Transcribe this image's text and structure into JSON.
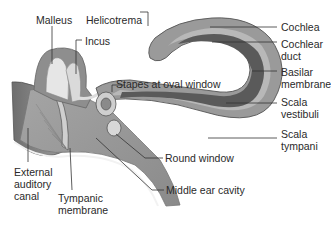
{
  "diagram": {
    "colors": {
      "background": "#ffffff",
      "outer_tissue": "#8c8c8c",
      "cochlea_outer": "#9a9a9a",
      "cochlea_light": "#b5b5b5",
      "cochlear_duct": "#5a5a5a",
      "ossicle_light": "#e6e6e6",
      "leader_line": "#333333",
      "text": "#2a2a2a"
    },
    "labels": {
      "malleus": "Malleus",
      "incus": "Incus",
      "helicotrema": "Helicotrema",
      "stapes": "Stapes at oval window",
      "cochlea": "Cochlea",
      "cochlear_duct": "Cochlear\nduct",
      "basilar_membrane": "Basilar\nmembrane",
      "scala_vestibuli": "Scala\nvestibuli",
      "scala_tympani": "Scala\ntympani",
      "round_window": "Round window",
      "middle_ear_cavity": "Middle ear cavity",
      "external_auditory_canal": "External\nauditory\ncanal",
      "tympanic_membrane": "Tympanic\nmembrane"
    }
  }
}
